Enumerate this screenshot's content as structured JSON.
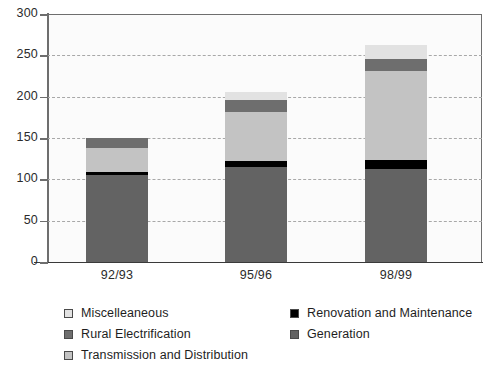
{
  "chart_data": {
    "type": "bar",
    "subtype": "stacked",
    "title": "",
    "xlabel": "",
    "ylabel": "",
    "categories": [
      "92/93",
      "95/96",
      "98/99"
    ],
    "ylim": [
      0,
      300
    ],
    "yticks": [
      0,
      50,
      100,
      150,
      200,
      250,
      300
    ],
    "ytick_labels": [
      "0",
      "50",
      "100",
      "150",
      "200",
      "250",
      "300"
    ],
    "grid": true,
    "grid_style": "dashed-horizontal",
    "legend_position": "bottom",
    "series": [
      {
        "name": "Generation",
        "color": "#636363",
        "values": [
          105,
          115,
          113
        ]
      },
      {
        "name": "Renovation and Maintenance",
        "color": "#000000",
        "values": [
          4,
          7,
          10
        ]
      },
      {
        "name": "Transmission and Distribution",
        "color": "#c3c3c3",
        "values": [
          29,
          59,
          108
        ]
      },
      {
        "name": "Rural Electrification",
        "color": "#6e6e6e",
        "values": [
          12,
          15,
          15
        ]
      },
      {
        "name": "Miscelleaneous",
        "color": "#e2e2e2",
        "values": [
          0,
          10,
          17
        ]
      }
    ],
    "totals": [
      150,
      206,
      263
    ],
    "stack_order_bottom_to_top": [
      "Generation",
      "Renovation and Maintenance",
      "Transmission and Distribution",
      "Rural Electrification",
      "Miscelleaneous"
    ]
  },
  "legend": {
    "left_column": [
      {
        "label": "Miscelleaneous",
        "color": "#e2e2e2"
      },
      {
        "label": "Rural Electrification",
        "color": "#6e6e6e"
      },
      {
        "label": "Transmission and Distribution",
        "color": "#c3c3c3"
      }
    ],
    "right_column": [
      {
        "label": "Renovation and Maintenance",
        "color": "#000000"
      },
      {
        "label": "Generation",
        "color": "#636363"
      }
    ]
  },
  "colors": {
    "plot_background": "#fbfbfb",
    "axis": "#6e6e6e",
    "gridline": "#a8a8a8",
    "text": "#2b2b2b"
  }
}
